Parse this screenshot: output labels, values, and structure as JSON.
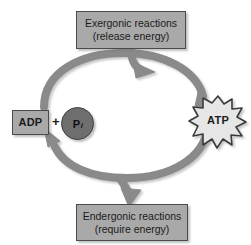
{
  "diagram": {
    "background_color": "#ffffff",
    "arrow_color": "#8a8a8a",
    "arrow_outline_color": "#5e5e5e",
    "box_fill_color": "#a9a9a9",
    "box_border_color": "#4a4a4a",
    "pi_fill_color": "#6e6e6e",
    "atp_fill_color": "#e6e6e6",
    "atp_outline_color": "#3a3a3a",
    "text_color": "#1b1b1b"
  },
  "boxes": {
    "exergonic": {
      "line1": "Exergonic reactions",
      "line2": "(release energy)"
    },
    "endergonic": {
      "line1": "Endergonic reactions",
      "line2": "(require energy)"
    },
    "adp": {
      "label": "ADP"
    }
  },
  "symbols": {
    "plus": "+",
    "phosphate_main": "P",
    "phosphate_subscript": "i",
    "atp": "ATP"
  }
}
